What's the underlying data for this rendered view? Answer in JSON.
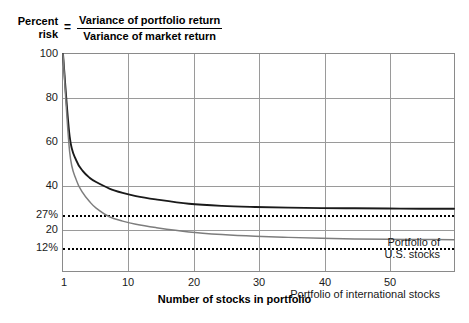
{
  "formula": {
    "lhs_line1": "Percent",
    "lhs_line2": "risk",
    "equals": "=",
    "numerator": "Variance of portfolio return",
    "denominator": "Variance of market return"
  },
  "axes": {
    "x_title": "Number of stocks in portfolio",
    "x_ticks": [
      "1",
      "10",
      "20",
      "30",
      "40",
      "50"
    ],
    "y_ticks": [
      "100",
      "80",
      "60",
      "40",
      "20"
    ],
    "y_special": [
      "27%",
      "12%"
    ]
  },
  "annotations": {
    "us_line1": "Portfolio of",
    "us_line2": "U.S. stocks",
    "intl": "Portfolio of international stocks"
  },
  "colors": {
    "us_curve": "#1a1a1a",
    "intl_curve": "#7d7d7d",
    "grid": "#9a9a9a",
    "frame": "#8a8a8a",
    "dotted": "#000000",
    "text": "#1a1a1a",
    "background": "#ffffff"
  },
  "chart_data": {
    "type": "line",
    "xlabel": "Number of stocks in portfolio",
    "ylabel": "Percent risk",
    "xlim": [
      1,
      60
    ],
    "ylim": [
      0,
      100
    ],
    "grid": true,
    "legend": "inline-annotations",
    "x_ticks": [
      1,
      10,
      20,
      30,
      40,
      50
    ],
    "y_ticks": [
      20,
      40,
      60,
      80,
      100
    ],
    "reference_lines": [
      {
        "label": "27%",
        "value": 27,
        "style": "dotted",
        "annotation": "Portfolio of U.S. stocks"
      },
      {
        "label": "12%",
        "value": 12,
        "style": "dotted",
        "annotation": "Portfolio of international stocks"
      }
    ],
    "series": [
      {
        "name": "Portfolio of U.S. stocks",
        "color": "#1a1a1a",
        "asymptote": 27,
        "x": [
          1,
          2,
          3,
          4,
          5,
          6,
          8,
          10,
          12,
          15,
          20,
          25,
          30,
          35,
          40,
          45,
          50,
          55,
          60
        ],
        "y": [
          100,
          62,
          51,
          46,
          43,
          41,
          38,
          36,
          34.5,
          33,
          31,
          30,
          29.5,
          29.2,
          29,
          28.9,
          28.8,
          28.7,
          28.7
        ]
      },
      {
        "name": "Portfolio of international stocks",
        "color": "#7d7d7d",
        "asymptote": 12,
        "x": [
          1,
          2,
          3,
          4,
          5,
          6,
          8,
          10,
          12,
          15,
          20,
          25,
          30,
          35,
          40,
          45,
          50,
          55,
          60
        ],
        "y": [
          100,
          55,
          42,
          36,
          32,
          29,
          25,
          23,
          21.5,
          20,
          18,
          16.8,
          16,
          15.5,
          15.1,
          14.8,
          14.6,
          14.5,
          14.4
        ]
      }
    ]
  }
}
